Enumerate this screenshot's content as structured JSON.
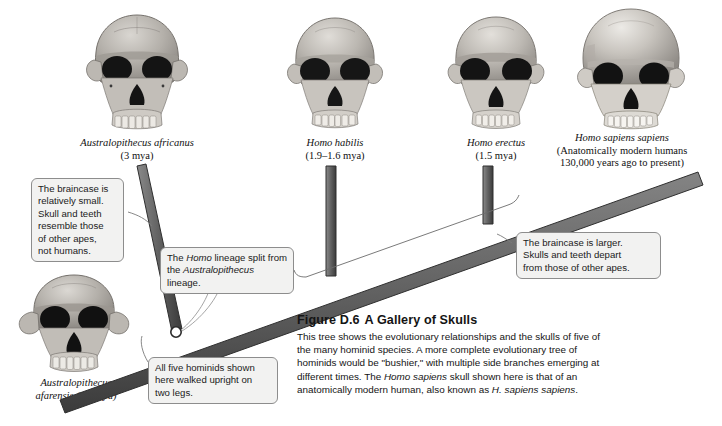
{
  "figure": {
    "number": "Figure D.6",
    "title": "A Gallery of Skulls",
    "body": "This tree shows the evolutionary relationships and the skulls of five of the many hominid species. A more complete evolutionary tree of hominids would be \"bushier,\" with multiple side branches emerging at different times. The Homo sapiens skull shown here is that of an anatomically modern human, also known as H. sapiens sapiens."
  },
  "species": [
    {
      "id": "australopithecus-afarensis",
      "name": "Australopithecus",
      "name_line2": "afarensis (3.5 mya)",
      "age": "",
      "skull": "skull-australopithecus-afarensis"
    },
    {
      "id": "australopithecus-africanus",
      "name": "Australopithecus africanus",
      "age": "(3 mya)",
      "skull": "skull-australopithecus-africanus"
    },
    {
      "id": "homo-habilis",
      "name": "Homo habilis",
      "age": "(1.9–1.6 mya)",
      "skull": "skull-homo-habilis"
    },
    {
      "id": "homo-erectus",
      "name": "Homo erectus",
      "age": "(1.5 mya)",
      "skull": "skull-homo-erectus"
    },
    {
      "id": "homo-sapiens-sapiens",
      "name": "Homo sapiens sapiens",
      "age": "(Anatomically modern humans",
      "age_line2": "130,000 years ago to present)",
      "skull": "skull-homo-sapiens-sapiens"
    }
  ],
  "callouts": {
    "left": {
      "id": "callout-braincase-small",
      "lines": [
        "The braincase is",
        "relatively small.",
        "Skull and teeth",
        "resemble those",
        "of other apes,",
        "not humans."
      ]
    },
    "split": {
      "id": "callout-lineage-split",
      "line1_pre": "The ",
      "line1_italic": "Homo",
      "line1_post": " lineage split from",
      "line2_pre": "the ",
      "line2_italic": "Australopithecus",
      "line2_post": " lineage."
    },
    "right": {
      "id": "callout-braincase-larger",
      "lines": [
        "The braincase is larger.",
        "Skulls and teeth depart",
        "from those of other apes."
      ]
    },
    "bottom": {
      "id": "callout-upright-walking",
      "lines": [
        "All five hominids shown",
        "here walked upright on",
        "two legs."
      ]
    }
  },
  "colors": {
    "branch_dark": "#4a4a4a",
    "branch_fill": "#6e6e6e",
    "callout_bg": "#f2f2f1",
    "callout_border": "#8d8d8d",
    "text": "#141414"
  }
}
